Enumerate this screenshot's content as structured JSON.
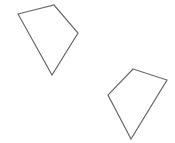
{
  "canvas": {
    "width": 175,
    "height": 143,
    "background": "#ffffff"
  },
  "shapes": [
    {
      "id": "quad-1",
      "type": "quadrilateral",
      "points": "18,14 54,5 78,33 52,75",
      "stroke": "#6a6a6a",
      "fill": "none"
    },
    {
      "id": "quad-2",
      "type": "quadrilateral",
      "points": "133,69 167,80 131,139 108,95",
      "stroke": "#6a6a6a",
      "fill": "none"
    }
  ]
}
